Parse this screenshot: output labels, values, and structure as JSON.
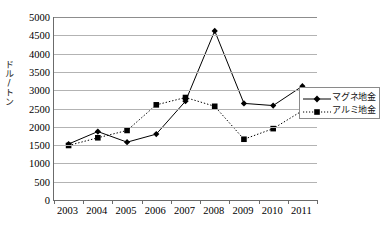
{
  "chart_data": {
    "type": "line",
    "title": "",
    "xlabel": "",
    "ylabel": "ドル/トン",
    "categories": [
      "2003",
      "2004",
      "2005",
      "2006",
      "2007",
      "2008",
      "2009",
      "2010",
      "2011"
    ],
    "x": [
      2003,
      2004,
      2005,
      2006,
      2007,
      2008,
      2009,
      2010,
      2011
    ],
    "ylim": [
      0,
      5000
    ],
    "ytick_step": 500,
    "yticks": [
      "5000",
      "4500",
      "4000",
      "3500",
      "3000",
      "2500",
      "2000",
      "1500",
      "1000",
      "500",
      "0"
    ],
    "ytick_values": [
      5000,
      4500,
      4000,
      3500,
      3000,
      2500,
      2000,
      1500,
      1000,
      500,
      0
    ],
    "grid": true,
    "legend_position": "right",
    "series": [
      {
        "name": "マグネ地金",
        "style": "solid",
        "marker": "diamond",
        "color": "#000000",
        "values": [
          1530,
          1870,
          1580,
          1800,
          2700,
          4620,
          2640,
          2580,
          3110
        ]
      },
      {
        "name": "アルミ地金",
        "style": "dotted",
        "marker": "square",
        "color": "#000000",
        "values": [
          1490,
          1700,
          1900,
          2600,
          2800,
          2560,
          1660,
          1950,
          2440
        ]
      }
    ]
  },
  "legend": {
    "items": [
      {
        "label": "マグネ地金"
      },
      {
        "label": "アルミ地金"
      }
    ]
  }
}
